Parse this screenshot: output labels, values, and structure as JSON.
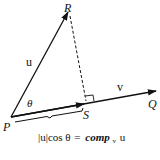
{
  "diagram": {
    "points": {
      "P": {
        "label": "P",
        "x": 11,
        "y": 117
      },
      "R": {
        "label": "R",
        "x": 69,
        "y": 11
      },
      "Q": {
        "label": "Q",
        "x": 155,
        "y": 91
      },
      "S": {
        "label": "S",
        "x": 83,
        "y": 104
      }
    },
    "vectors": [
      {
        "name": "u",
        "label": "u",
        "from": "P",
        "to": "R"
      },
      {
        "name": "v",
        "label": "v",
        "from": "P",
        "to": "Q"
      }
    ],
    "angle_label": "θ",
    "perpendicular": {
      "from": "R",
      "to": "S",
      "style": "dashed"
    },
    "formula": {
      "lhs": "|u|cos θ",
      "equals": "=",
      "rhs_comp": "comp",
      "rhs_sub": "v",
      "rhs_arg": "u"
    },
    "colors": {
      "ink": "#111111",
      "background": "#ffffff"
    }
  }
}
